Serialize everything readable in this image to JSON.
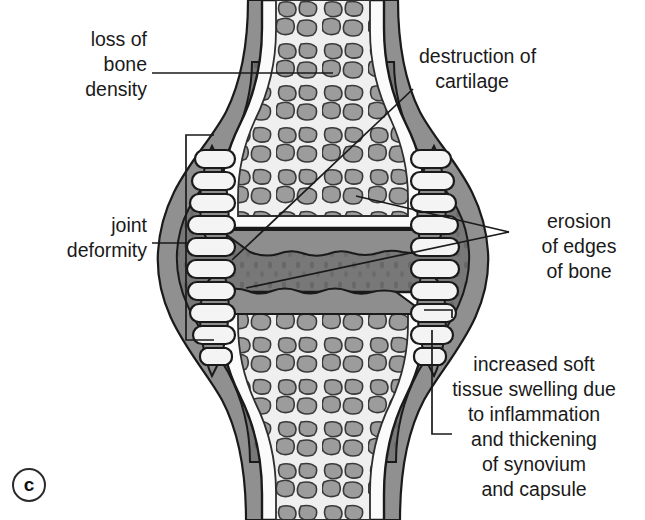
{
  "figure": {
    "panel_letter": "c",
    "palette": {
      "background": "#ffffff",
      "outline": "#1a1a1a",
      "trabecular_fill": "#9a9a9a",
      "trabecular_bg": "#efefef",
      "marrow_light": "#e8e8e8",
      "cortex_gray": "#8e8e8e",
      "capsule_gray": "#909090",
      "synovium_gray": "#777777",
      "text": "#1a1a1a"
    }
  },
  "labels": {
    "loss_of_bone_density": "loss of\nbone\ndensity",
    "joint_deformity": "joint\ndeformity",
    "destruction_of_cartilage": "destruction of\n   cartilage",
    "erosion_of_edges_of_bone": "erosion\nof edges\nof bone",
    "increased_soft_tissue": "increased soft\ntissue swelling due\nto inflammation\nand thickening\nof synovium\nand capsule"
  },
  "annotations": [
    {
      "name": "loss-of-bone-density",
      "text": "loss of bone density",
      "align": "right",
      "leader": "straight-horizontal",
      "target": "trabecular bone of upper shaft"
    },
    {
      "name": "joint-deformity",
      "text": "joint deformity",
      "align": "right",
      "leader": "straight-horizontal-to-bracket",
      "target": "left capsule bracket"
    },
    {
      "name": "destruction-of-cartilage",
      "text": "destruction of cartilage",
      "align": "left",
      "leader": "diagonal",
      "target": "narrowed joint space"
    },
    {
      "name": "erosion-of-edges-of-bone",
      "text": "erosion of edges of bone",
      "align": "center",
      "leader": "two-diagonals",
      "target": "eroded bone margins both sides of joint"
    },
    {
      "name": "increased-soft-tissue-swelling",
      "text": "increased soft tissue swelling due to inflammation and thickening of synovium and capsule",
      "align": "center",
      "leader": "right-bracket",
      "target": "swollen capsule and synovium"
    }
  ]
}
